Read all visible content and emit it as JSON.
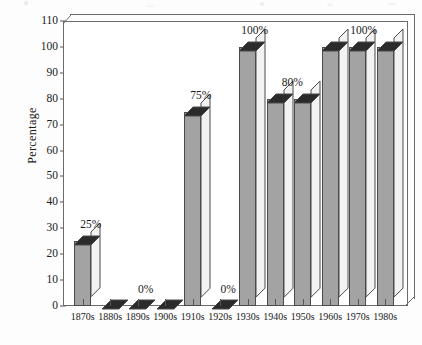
{
  "chart_data": {
    "type": "bar",
    "title": "",
    "subtitle": "",
    "xlabel": "",
    "ylabel": "Percentage",
    "categories": [
      "1870s",
      "1880s",
      "1890s",
      "1900s",
      "1910s",
      "1920s",
      "1930s",
      "1940s",
      "1950s",
      "1960s",
      "1970s",
      "1980s"
    ],
    "values": [
      25,
      0,
      0,
      0,
      75,
      0,
      100,
      80,
      80,
      100,
      100,
      100
    ],
    "value_labels": [
      {
        "category": "1870s",
        "text": "25%"
      },
      {
        "category": "1890s",
        "text": "0%"
      },
      {
        "category": "1910s",
        "text": "75%"
      },
      {
        "category": "1920s",
        "text": "0%"
      },
      {
        "category": "1930s",
        "text": "100%"
      },
      {
        "category": "1940s",
        "text": "80%"
      },
      {
        "category": "1970s",
        "text": "100%"
      }
    ],
    "ylim": [
      0,
      110
    ],
    "yticks": [
      0,
      10,
      20,
      30,
      40,
      50,
      60,
      70,
      80,
      90,
      100,
      110
    ],
    "ytick_labels": [
      "0",
      "10",
      "20",
      "30",
      "40",
      "50",
      "60",
      "70",
      "80",
      "90",
      "100",
      "110"
    ],
    "grid": false,
    "legend": null,
    "style": "3d-bar",
    "colors": {
      "bar_front": "#a3a3a3",
      "bar_top": "#2b2b2b",
      "bar_side": "#f2f2f2",
      "bar_outline": "#4a4a4a",
      "frame": "#6b6b6b",
      "text": "#1a1a1a",
      "background": "#fdfdfd"
    }
  }
}
